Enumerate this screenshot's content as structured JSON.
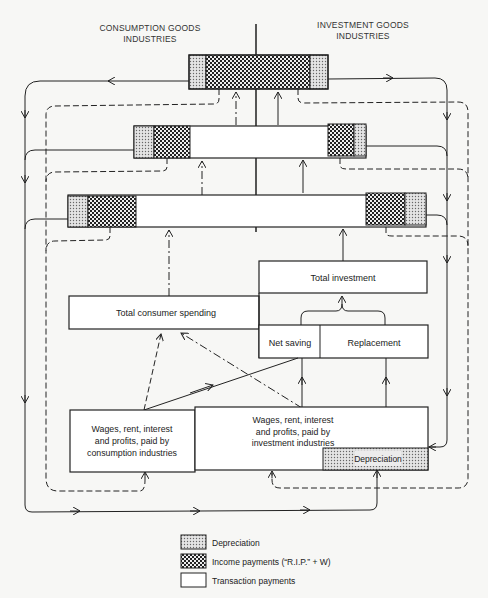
{
  "headers": {
    "left": [
      "CONSUMPTION GOODS",
      "INDUSTRIES"
    ],
    "right": [
      "INVESTMENT GOODS",
      "INDUSTRIES"
    ]
  },
  "boxes": {
    "total_investment": "Total investment",
    "total_consumer_spending": "Total consumer spending",
    "net_saving": "Net saving",
    "replacement": "Replacement",
    "wages_consumption": [
      "Wages, rent, interest",
      "and profits, paid by",
      "consumption industries"
    ],
    "wages_investment": [
      "Wages, rent, interest",
      "and profits, paid by",
      "investment industries"
    ],
    "depreciation_inner": "Depreciation"
  },
  "legend": [
    {
      "pattern": "depreciation",
      "label": "Depreciation"
    },
    {
      "pattern": "income",
      "label": "Income payments (“R.I.P.” + W)"
    },
    {
      "pattern": "transaction",
      "label": "Transaction payments"
    }
  ],
  "colors": {
    "line": "#222222",
    "background": "#f7f7f5",
    "depreciation_fill": "#c8c8c8",
    "income_fill": "#555555"
  }
}
